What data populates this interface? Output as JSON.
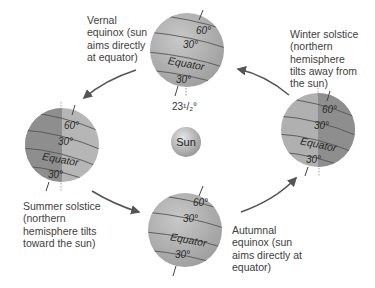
{
  "diagram": {
    "center_label": "Sun",
    "tilt_label": "23¹/₂°",
    "colors": {
      "globe_light": "#b4b4b4",
      "globe_dark": "#8c8c8c",
      "sun": "#c8c8c8",
      "arrow": "#555555",
      "text": "#404040"
    },
    "globes": [
      {
        "id": "vernal-equinox",
        "caption": "Vernal\nequinox (sun\naims directly\nat equator)",
        "latitudes": [
          "60°",
          "30°",
          "Equator",
          "30°"
        ]
      },
      {
        "id": "winter-solstice",
        "caption": "Winter solstice\n(northern\nhemisphere\ntilts away from\nthe sun)",
        "latitudes": [
          "60°",
          "30°",
          "Equator",
          "30°"
        ]
      },
      {
        "id": "autumnal-equinox",
        "caption": "Autumnal\nequinox (sun\naims directly at\nequator)",
        "latitudes": [
          "60°",
          "30°",
          "Equator",
          "30°"
        ]
      },
      {
        "id": "summer-solstice",
        "caption": "Summer solstice\n(northern\nhemisphere tilts\ntoward the sun)",
        "latitudes": [
          "60°",
          "30°",
          "Equator",
          "30°"
        ]
      }
    ]
  }
}
